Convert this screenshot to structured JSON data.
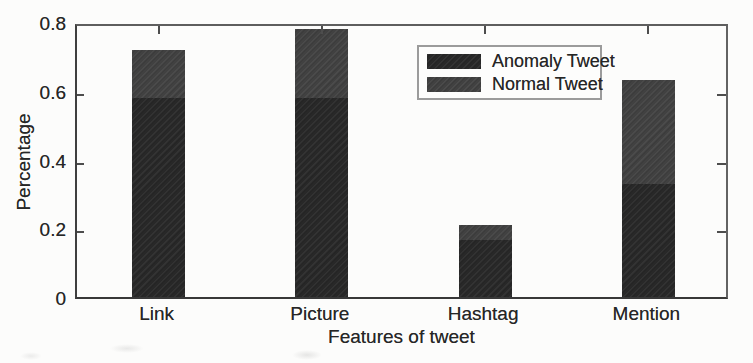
{
  "chart_data": {
    "type": "bar",
    "stacked": true,
    "title": "",
    "xlabel": "Features of tweet",
    "ylabel": "Percentage",
    "categories": [
      "Link",
      "Picture",
      "Hashtag",
      "Mention"
    ],
    "series": [
      {
        "name": "Anomaly Tweet",
        "color": "#282828",
        "values": [
          0.58,
          0.58,
          0.165,
          0.33
        ]
      },
      {
        "name": "Normal Tweet",
        "color": "#414141",
        "values": [
          0.14,
          0.2,
          0.045,
          0.3
        ]
      }
    ],
    "stack_totals": [
      0.72,
      0.78,
      0.21,
      0.63
    ],
    "ylim": [
      0,
      0.8
    ],
    "yticks": [
      0,
      0.2,
      0.4,
      0.6,
      0.8
    ],
    "ytick_labels": [
      "0",
      "0.2",
      "0.4",
      "0.6",
      "0.8"
    ],
    "grid": false,
    "legend_position": "upper-center-right",
    "legend_entries": [
      "Anomaly Tweet",
      "Normal Tweet"
    ]
  },
  "colors": {
    "background": "#fcfcfb",
    "axis": "#3f3f3f",
    "text": "#262626",
    "anomaly_fill": "#282828",
    "normal_fill": "#414141",
    "legend_border": "#9b9b9b"
  }
}
